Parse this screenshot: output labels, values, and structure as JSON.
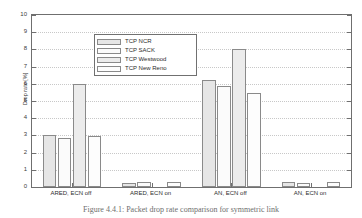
{
  "chart_data": {
    "type": "bar",
    "title": "",
    "xlabel": "",
    "ylabel": "Drop rate [%]",
    "ylim": [
      0,
      10
    ],
    "yticks": [
      0,
      1,
      2,
      3,
      4,
      5,
      6,
      7,
      8,
      9,
      10
    ],
    "grid": true,
    "legend_position": "upper left",
    "categories": [
      "ARED, ECN off",
      "ARED, ECN on",
      "AN, ECN off",
      "AN, ECN on"
    ],
    "series": [
      {
        "name": "TCP NCR",
        "values": [
          3.0,
          0.25,
          6.2,
          0.28
        ]
      },
      {
        "name": "TCP SACK",
        "values": [
          2.85,
          0.28,
          5.9,
          0.25
        ]
      },
      {
        "name": "TCP Westwood",
        "values": [
          6.0,
          0.0,
          8.05,
          0.0
        ]
      },
      {
        "name": "TCP New Reno",
        "values": [
          2.95,
          0.3,
          5.45,
          0.27
        ]
      }
    ]
  },
  "legend": {
    "items": [
      {
        "label": "TCP NCR"
      },
      {
        "label": "TCP SACK"
      },
      {
        "label": "TCP Westwood"
      },
      {
        "label": "TCP New Reno"
      }
    ]
  },
  "axes": {
    "y_title": "Drop rate [%]",
    "y_tick_labels": [
      "0",
      "1",
      "2",
      "3",
      "4",
      "5",
      "6",
      "7",
      "8",
      "9",
      "10"
    ],
    "x_tick_labels": [
      "ARED, ECN off",
      "ARED, ECN on",
      "AN, ECN off",
      "AN, ECN on"
    ]
  },
  "caption": {
    "text": "Figure 4.4.1: Packet drop rate comparison for symmetric link"
  },
  "colors": {
    "axis": "#6f6f6f",
    "grid": "#c8c8c8",
    "bar_edge": "#8a8a8a",
    "series_fill": [
      "#e6e6e6",
      "#fbfbfb",
      "#ececec",
      "#fdfdfd"
    ],
    "text": "#2e2e2e",
    "caption": "#6e6e6e"
  }
}
